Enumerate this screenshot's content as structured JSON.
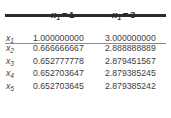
{
  "table": {
    "columns": [
      {
        "key": "label",
        "header": ""
      },
      {
        "key": "v1",
        "header": "x1 = 1",
        "var": "x",
        "sub": "1",
        "eq": "=",
        "value": "1"
      },
      {
        "key": "v2",
        "header": "x1 = 3",
        "var": "x",
        "sub": "1",
        "eq": "=",
        "value": "3"
      }
    ],
    "rows": [
      {
        "label_var": "x",
        "label_sub": "1",
        "v1": "1.000000000",
        "v2": "3.000000000"
      },
      {
        "label_var": "x",
        "label_sub": "2",
        "v1": "0.666666667",
        "v2": "2.888888889"
      },
      {
        "label_var": "x",
        "label_sub": "3",
        "v1": "0.652777778",
        "v2": "2.879451567"
      },
      {
        "label_var": "x",
        "label_sub": "4",
        "v1": "0.652703647",
        "v2": "2.879385245"
      },
      {
        "label_var": "x",
        "label_sub": "5",
        "v1": "0.652703645",
        "v2": "2.879385242"
      }
    ],
    "rules": {
      "top_color": "#2b2b2b",
      "header_color": "#8c8c8c"
    }
  }
}
